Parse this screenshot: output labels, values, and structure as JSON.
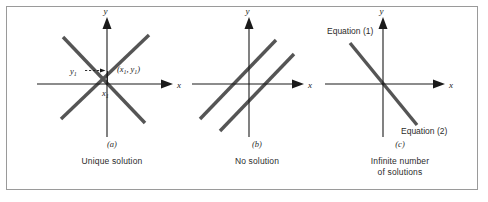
{
  "figure": {
    "border_color": "#9a9a9a",
    "background": "#ffffff",
    "line_color": "#555555",
    "axis_color": "#1a1a1a",
    "text_color": "#2b2b2b"
  },
  "panels": [
    {
      "id": "a",
      "letter": "(a)",
      "caption_line1": "Unique solution",
      "caption_line2": "",
      "axis_x_label": "x",
      "axis_y_label": "y",
      "point_label": "(x₁, y₁)",
      "tick_x_label": "x₁",
      "tick_y_label": "y₁",
      "description": "Two lines intersecting at one point"
    },
    {
      "id": "b",
      "letter": "(b)",
      "caption_line1": "No solution",
      "caption_line2": "",
      "axis_x_label": "x",
      "axis_y_label": "y",
      "description": "Two parallel lines"
    },
    {
      "id": "c",
      "letter": "(c)",
      "caption_line1": "Infinite number",
      "caption_line2": "of solutions",
      "axis_x_label": "x",
      "axis_y_label": "y",
      "equation_1_label": "Equation (1)",
      "equation_2_label": "Equation (2)",
      "description": "Two coincident lines drawn as one"
    }
  ]
}
